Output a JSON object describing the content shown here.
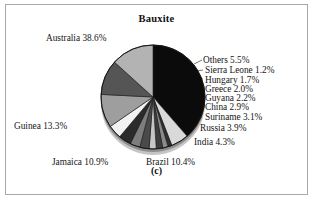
{
  "figure": {
    "title": "Bauxite",
    "caption": "(c)"
  },
  "chart_data": {
    "type": "pie",
    "title": "Bauxite",
    "xlabel": "",
    "ylabel": "",
    "unit": "percent",
    "legend_position": "none",
    "grid": false,
    "start_angle_deg": 0,
    "direction": "clockwise",
    "categories": [
      "Australia",
      "Others",
      "Sierra Leone",
      "Hungary",
      "Greece",
      "Guyana",
      "China",
      "Suriname",
      "Russia",
      "India",
      "Brazil",
      "Jamaica",
      "Guinea"
    ],
    "values": [
      38.6,
      5.5,
      1.2,
      1.7,
      2.0,
      2.2,
      2.9,
      3.1,
      3.9,
      4.3,
      10.4,
      10.9,
      13.3
    ],
    "labels": [
      "Australia 38.6%",
      "Others 5.5%",
      "Sierra Leone 1.2%",
      "Hungary 1.7%",
      "Greece 2.0%",
      "Guyana 2.2%",
      "China 2.9%",
      "Suriname 3.1%",
      "Russia 3.9%",
      "India 4.3%",
      "Brazil 10.4%",
      "Jamaica 10.9%",
      "Guinea 13.3%"
    ],
    "colors": [
      "#0b0b0b",
      "#d9d9d9",
      "#2f2f2f",
      "#8a8a8a",
      "#3d3d3d",
      "#c6c6c6",
      "#4a4a4a",
      "#7d7d7d",
      "#2b2b2b",
      "#f2f2f2",
      "#9e9e9e",
      "#555555",
      "#b3b3b3"
    ]
  },
  "slice_labels": {
    "australia": "Australia 38.6%",
    "others": "Others 5.5%",
    "sierra_leone": "Sierra Leone 1.2%",
    "hungary": "Hungary 1.7%",
    "greece": "Greece 2.0%",
    "guyana": "Guyana 2.2%",
    "china": "China 2.9%",
    "suriname": "Suriname 3.1%",
    "russia": "Russia 3.9%",
    "india": "India 4.3%",
    "brazil": "Brazil 10.4%",
    "jamaica": "Jamaica 10.9%",
    "guinea": "Guinea 13.3%"
  }
}
